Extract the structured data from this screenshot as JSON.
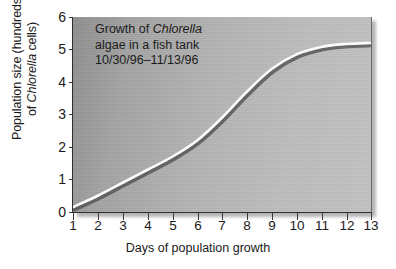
{
  "chart_data": {
    "type": "line",
    "annotation_lines": [
      {
        "pre": "Growth of ",
        "italic": "Chlorella",
        "post": ""
      },
      {
        "pre": "algae in a fish tank",
        "italic": "",
        "post": ""
      },
      {
        "pre": "10/30/96–11/13/96",
        "italic": "",
        "post": ""
      }
    ],
    "xlabel": "Days of population growth",
    "ylabel_lines": [
      {
        "pre": "Population size (hundreds",
        "italic": "",
        "post": ""
      },
      {
        "pre": "of ",
        "italic": "Chlorella",
        "post": " cells)"
      }
    ],
    "xlim": [
      1,
      13
    ],
    "ylim": [
      0,
      6
    ],
    "xticks": [
      "1",
      "2",
      "3",
      "4",
      "5",
      "6",
      "7",
      "8",
      "9",
      "10",
      "11",
      "12",
      "13"
    ],
    "yticks": [
      "0",
      "1",
      "2",
      "3",
      "4",
      "5",
      "6"
    ],
    "grid": false,
    "legend": "none",
    "x": [
      1,
      2,
      3,
      4,
      5,
      6,
      7,
      8,
      9,
      10,
      11,
      12,
      13
    ],
    "values": [
      0.15,
      0.5,
      0.9,
      1.3,
      1.7,
      2.2,
      2.9,
      3.7,
      4.4,
      4.85,
      5.08,
      5.17,
      5.2
    ],
    "series": [
      {
        "name": "Chlorella population",
        "values": [
          0.15,
          0.5,
          0.9,
          1.3,
          1.7,
          2.2,
          2.9,
          3.7,
          4.4,
          4.85,
          5.08,
          5.17,
          5.2
        ]
      }
    ],
    "line_color": "#ffffff",
    "line_shadow_color": "#4a4a4a",
    "panel_color": "#b0b0b0",
    "axis_color": "#2e2e2e",
    "text_color": "#1a1a1a"
  }
}
